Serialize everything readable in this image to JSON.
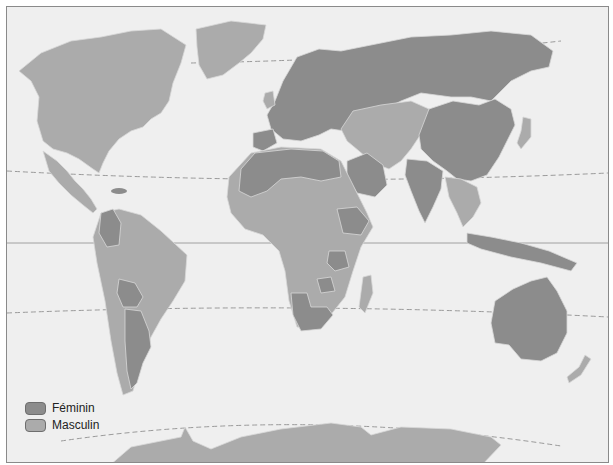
{
  "map": {
    "type": "world-choropleth",
    "colors": {
      "background": "#efefef",
      "feminin": "#8c8c8c",
      "masculin": "#ababab",
      "border_line": "#d8d8d8",
      "latitude_line": "#9a9a9a"
    },
    "regions": {
      "feminin": [
        "Europe",
        "Russia",
        "China",
        "India",
        "North Africa",
        "Saudi Arabia",
        "Colombia",
        "Bolivia",
        "Argentina",
        "Australia",
        "Tanzania",
        "Ethiopia",
        "Namibia",
        "South Africa",
        "Zimbabwe",
        "Mongolia",
        "Caribbean islands (Haiti/Dominican Rep.)"
      ],
      "masculin": [
        "North America",
        "Greenland",
        "Central America",
        "Brazil",
        "Peru",
        "Venezuela",
        "Central Asia",
        "Iran",
        "Kazakhstan",
        "Japan",
        "Southeast Asia",
        "Sub-Saharan Africa",
        "Madagascar",
        "Antarctica",
        "New Zealand",
        "Chile",
        "Uruguay"
      ]
    }
  },
  "legend": {
    "items": [
      {
        "label": "Féminin",
        "color": "#8c8c8c"
      },
      {
        "label": "Masculin",
        "color": "#ababab"
      }
    ]
  }
}
